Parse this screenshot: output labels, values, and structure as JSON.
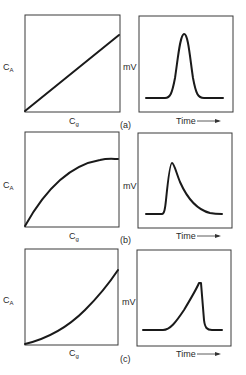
{
  "figure": {
    "panels": [
      {
        "id": "a",
        "caption": "(a)",
        "calibration": {
          "ylabel_main": "C",
          "ylabel_sub": "A",
          "xlabel_main": "C",
          "xlabel_sub": "g",
          "shape": "linear"
        },
        "signal": {
          "ylabel": "mV",
          "xlabel": "Time",
          "arrow": "→",
          "shape": "symmetric Gaussian peak"
        }
      },
      {
        "id": "b",
        "caption": "(b)",
        "calibration": {
          "ylabel_main": "C",
          "ylabel_sub": "A",
          "xlabel_main": "C",
          "xlabel_sub": "g",
          "shape": "concave (saturating)"
        },
        "signal": {
          "ylabel": "mV",
          "xlabel": "Time",
          "arrow": "→",
          "shape": "tailing peak (sharp front, slow decay)"
        }
      },
      {
        "id": "c",
        "caption": "(c)",
        "calibration": {
          "ylabel_main": "C",
          "ylabel_sub": "A",
          "xlabel_main": "C",
          "xlabel_sub": "g",
          "shape": "convex (upward curving)"
        },
        "signal": {
          "ylabel": "mV",
          "xlabel": "Time",
          "arrow": "→",
          "shape": "fronting peak (slow rise, sharp drop)"
        }
      }
    ]
  }
}
